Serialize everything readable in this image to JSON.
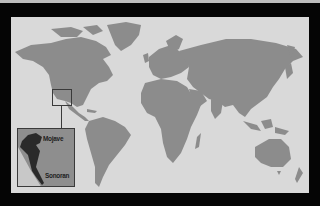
{
  "map": {
    "type": "world-locator-map",
    "colors": {
      "background": "#050505",
      "ocean": "#d9d9d9",
      "land": "#8c8c8c",
      "frame": "#3a3a3a",
      "desert": "#2a2a2a",
      "inset_light": "#c8c8c8"
    },
    "locator": {
      "region": "Southwestern North America",
      "icon": "locator-rectangle"
    },
    "inset": {
      "labels": {
        "mojave": "Mojave",
        "sonoran": "Sonoran"
      }
    }
  }
}
